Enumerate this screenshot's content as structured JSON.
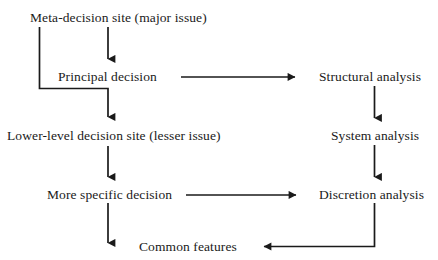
{
  "diagram": {
    "type": "flow-diagram",
    "background_color": "#ffffff",
    "line_color": "#1a1a1a",
    "text_color": "#1a1a1a",
    "nodes": [
      {
        "id": "meta_decision",
        "label": "Meta-decision site (major issue)",
        "x": 30,
        "y": 10
      },
      {
        "id": "principal_decision",
        "label": "Principal decision",
        "x": 58,
        "y": 69
      },
      {
        "id": "structural_analysis",
        "label": "Structural analysis",
        "x": 319,
        "y": 69
      },
      {
        "id": "lower_level",
        "label": "Lower-level decision site (lesser issue)",
        "x": 7,
        "y": 128
      },
      {
        "id": "system_analysis",
        "label": "System analysis",
        "x": 331,
        "y": 128
      },
      {
        "id": "more_specific",
        "label": "More specific decision",
        "x": 47,
        "y": 187
      },
      {
        "id": "discretion_analysis",
        "label": "Discretion analysis",
        "x": 319,
        "y": 187
      },
      {
        "id": "common_features",
        "label": "Common features",
        "x": 139,
        "y": 239
      }
    ],
    "edges": [
      {
        "id": "meta-to-principal",
        "from": "meta_decision",
        "to": "principal_decision",
        "kind": "vertical-arrow"
      },
      {
        "id": "meta-to-lower-level",
        "from": "meta_decision",
        "to": "lower_level",
        "kind": "elbow-arrow"
      },
      {
        "id": "principal-to-structural",
        "from": "principal_decision",
        "to": "structural_analysis",
        "kind": "horizontal-arrow"
      },
      {
        "id": "structural-to-system",
        "from": "structural_analysis",
        "to": "system_analysis",
        "kind": "vertical-arrow"
      },
      {
        "id": "lower-level-to-more-specific",
        "from": "lower_level",
        "to": "more_specific",
        "kind": "vertical-arrow"
      },
      {
        "id": "more-specific-to-discretion",
        "from": "more_specific",
        "to": "discretion_analysis",
        "kind": "horizontal-arrow"
      },
      {
        "id": "system-to-discretion",
        "from": "system_analysis",
        "to": "discretion_analysis",
        "kind": "vertical-arrow"
      },
      {
        "id": "discretion-to-common-features",
        "from": "discretion_analysis",
        "to": "common_features",
        "kind": "elbow-arrow"
      },
      {
        "id": "more-specific-downward-stub",
        "from": "more_specific",
        "to": "",
        "kind": "vertical-arrow"
      }
    ]
  }
}
